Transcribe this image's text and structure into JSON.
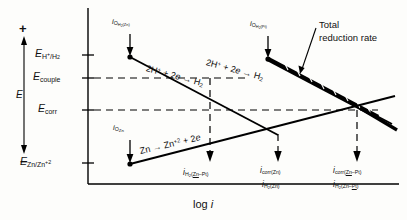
{
  "figure": {
    "type": "evans-diagram"
  },
  "axes": {
    "y_axis": {
      "label": "E",
      "positive_sign": "+",
      "negative_sign": "−"
    },
    "x_axis": {
      "label_prefix": "log",
      "label_symbol": "i"
    }
  },
  "potential_labels": [
    {
      "id": "e-h-h2",
      "base": "E",
      "sub_pre": "H",
      "sub_sup": "+",
      "sub_post": "/H",
      "sub_post_sub": "2"
    },
    {
      "id": "e-couple",
      "base": "E",
      "sub": "couple"
    },
    {
      "id": "e-corr",
      "base": "E",
      "sub": "corr"
    },
    {
      "id": "e-zn-zn2",
      "base": "E",
      "sub_pre": "Zn/Zn",
      "sub_sup": "+2"
    }
  ],
  "exchange_current_labels": [
    {
      "id": "io-h2-zn",
      "prefix": "i",
      "sub": "O",
      "subsub_pre": "H",
      "subsub_num": "2",
      "subsub_post": "(Zn)"
    },
    {
      "id": "io-h2-pt",
      "prefix": "i",
      "sub": "O",
      "subsub_pre": "H",
      "subsub_num": "2",
      "subsub_post": "(Pt)"
    },
    {
      "id": "io-zn",
      "prefix": "i",
      "sub": "O",
      "subsub_post": "Zn"
    }
  ],
  "bottom_current_labels": [
    {
      "id": "i-h2-zn-pt-left",
      "prefix": "i",
      "sub_pre": "H",
      "sub_num": "2",
      "sub_paren_open": "(",
      "sub_ul": "Zn",
      "sub_dash": "–Pt",
      "sub_paren_close": ")"
    },
    {
      "id": "i-corr-zn",
      "prefix": "i",
      "sub": "corr(Zn)"
    },
    {
      "id": "i-h2-zn",
      "prefix": "i",
      "sub_pre": "H",
      "sub_num": "2",
      "sub_post": "(Zn)"
    },
    {
      "id": "i-corr-zn-pt",
      "prefix": "i",
      "sub_pre": "corr(",
      "sub_ul": "Zn",
      "sub_post": "–Pt)"
    },
    {
      "id": "i-h2-zn-pt",
      "prefix": "i",
      "sub_pre": "H",
      "sub_num": "2",
      "sub_paren": "(Zn–",
      "sub_ul": "Pt",
      "sub_close": ")"
    }
  ],
  "reactions": {
    "cathodic_zn": {
      "left": "2H",
      "left_sup": "+",
      "plus": "+ 2",
      "electron": "e",
      "arrow": "→",
      "right": "H",
      "right_sub": "2"
    },
    "cathodic_pt": {
      "left": "2H",
      "left_sup": "+",
      "plus": "+ 2",
      "electron": "e",
      "arrow": "→",
      "right": "H",
      "right_sub": "2"
    },
    "anodic_zn": {
      "left": "Zn",
      "arrow": "→",
      "right": "Zn",
      "right_sup": "+2",
      "plus": "+ 2",
      "electron": "e"
    }
  },
  "annotations": {
    "total_reduction_rate_line1": "Total",
    "total_reduction_rate_line2": "reduction rate"
  },
  "colors": {
    "ink": "#111111",
    "paper": "#fdfdfb",
    "line": "#000000"
  }
}
